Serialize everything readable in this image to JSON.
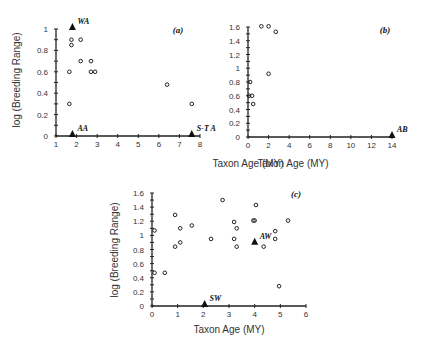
{
  "chart_data": [
    {
      "type": "scatter",
      "panel_label": "(a)",
      "title": "",
      "xlabel": "Taxon Age (MY)",
      "ylabel": "log (Breeding Range)",
      "xlim": [
        1,
        8
      ],
      "ylim": [
        0,
        1
      ],
      "x_ticks": [
        "1",
        "2",
        "3",
        "4",
        "5",
        "6",
        "7",
        "8"
      ],
      "y_ticks": [
        "0",
        "0.2",
        "0.4",
        "0.6",
        "0.8",
        "1"
      ],
      "grid": false,
      "series": [
        {
          "name": "circles",
          "marker": "open-circle",
          "points": [
            [
              1.75,
              0.9
            ],
            [
              1.75,
              0.85
            ],
            [
              2.2,
              0.9
            ],
            [
              1.65,
              0.6
            ],
            [
              2.2,
              0.7
            ],
            [
              2.7,
              0.7
            ],
            [
              2.7,
              0.6
            ],
            [
              2.9,
              0.6
            ],
            [
              1.65,
              0.3
            ],
            [
              6.4,
              0.48
            ],
            [
              7.6,
              0.3
            ]
          ]
        },
        {
          "name": "triangles",
          "marker": "filled-triangle",
          "points": [
            {
              "x": 1.8,
              "y": 1.0,
              "label": "WA"
            },
            {
              "x": 1.8,
              "y": 0.0,
              "label": "AA"
            },
            {
              "x": 7.6,
              "y": 0.0,
              "label": "S-T A"
            }
          ]
        }
      ]
    },
    {
      "type": "scatter",
      "panel_label": "(b)",
      "title": "",
      "xlabel": "Taxon Age (MY)",
      "ylabel": "",
      "xlim": [
        0,
        14
      ],
      "ylim": [
        0,
        1.6
      ],
      "x_ticks": [
        "0",
        "2",
        "4",
        "6",
        "8",
        "10",
        "12",
        "14"
      ],
      "y_ticks": [
        "0",
        "0.2",
        "0.4",
        "0.6",
        "0.8",
        "1",
        "1.2",
        "1.4",
        "1.6"
      ],
      "grid": false,
      "series": [
        {
          "name": "circles",
          "marker": "open-circle",
          "points": [
            [
              1.3,
              1.61
            ],
            [
              2.0,
              1.61
            ],
            [
              2.7,
              1.53
            ],
            [
              2.0,
              0.92
            ],
            [
              0.2,
              0.8
            ],
            [
              0.1,
              0.6
            ],
            [
              0.4,
              0.6
            ],
            [
              0.5,
              0.48
            ]
          ]
        },
        {
          "name": "triangles",
          "marker": "filled-triangle",
          "points": [
            {
              "x": 14,
              "y": 0.0,
              "label": "AB"
            }
          ]
        }
      ]
    },
    {
      "type": "scatter",
      "panel_label": "(c)",
      "title": "",
      "xlabel": "Taxon Age (MY)",
      "ylabel": "log (Breeding Range)",
      "xlim": [
        0,
        6
      ],
      "ylim": [
        0,
        1.6
      ],
      "x_ticks": [
        "0",
        "1",
        "2",
        "3",
        "4",
        "5",
        "6"
      ],
      "y_ticks": [
        "0",
        "0.2",
        "0.4",
        "0.6",
        "0.8",
        "1",
        "1.2",
        "1.4",
        "1.6"
      ],
      "grid": false,
      "series": [
        {
          "name": "circles",
          "marker": "open-circle",
          "points": [
            [
              0.1,
              1.07
            ],
            [
              0.1,
              0.47
            ],
            [
              0.5,
              0.47
            ],
            [
              0.9,
              1.29
            ],
            [
              0.9,
              0.84
            ],
            [
              1.1,
              1.1
            ],
            [
              1.1,
              0.9
            ],
            [
              1.55,
              1.14
            ],
            [
              2.3,
              0.95
            ],
            [
              2.75,
              1.5
            ],
            [
              3.2,
              1.19
            ],
            [
              3.3,
              1.1
            ],
            [
              3.2,
              0.95
            ],
            [
              3.3,
              0.84
            ],
            [
              3.95,
              1.21
            ],
            [
              4.0,
              1.21
            ],
            [
              4.05,
              1.43
            ],
            [
              4.35,
              0.84
            ],
            [
              4.8,
              1.06
            ],
            [
              4.8,
              0.95
            ],
            [
              4.95,
              0.28
            ],
            [
              5.3,
              1.21
            ]
          ]
        },
        {
          "name": "triangles",
          "marker": "filled-triangle",
          "points": [
            {
              "x": 4.0,
              "y": 0.88,
              "label": "AW"
            },
            {
              "x": 2.05,
              "y": 0.0,
              "label": "SW"
            }
          ]
        }
      ]
    }
  ]
}
